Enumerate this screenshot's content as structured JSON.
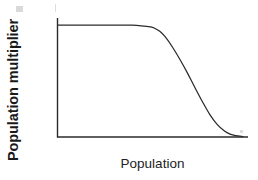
{
  "figure": {
    "background_color": "#ffffff",
    "line_color": "#2b2b2b",
    "axis_color": "#2b2b2b"
  },
  "chart_data": {
    "type": "line",
    "title": "",
    "xlabel": "Population",
    "ylabel": "Population multiplier",
    "grid": false,
    "legend": false,
    "xlim": [
      0,
      1
    ],
    "ylim": [
      0,
      1
    ],
    "axis_ticks": {
      "x": [],
      "y": []
    },
    "series": [
      {
        "name": "population multiplier",
        "x": [
          0.0,
          0.05,
          0.1,
          0.15,
          0.2,
          0.25,
          0.3,
          0.35,
          0.4,
          0.45,
          0.5,
          0.52,
          0.55,
          0.58,
          0.62,
          0.66,
          0.7,
          0.74,
          0.78,
          0.82,
          0.86,
          0.9,
          0.93,
          0.96,
          1.0
        ],
        "y": [
          1.0,
          1.0,
          1.0,
          1.0,
          1.0,
          1.0,
          1.0,
          1.0,
          1.0,
          0.995,
          0.985,
          0.975,
          0.945,
          0.895,
          0.8,
          0.69,
          0.57,
          0.44,
          0.315,
          0.2,
          0.11,
          0.05,
          0.022,
          0.008,
          0.0
        ]
      }
    ]
  },
  "labels": {
    "x_axis": "Population",
    "y_axis": "Population multiplier"
  }
}
